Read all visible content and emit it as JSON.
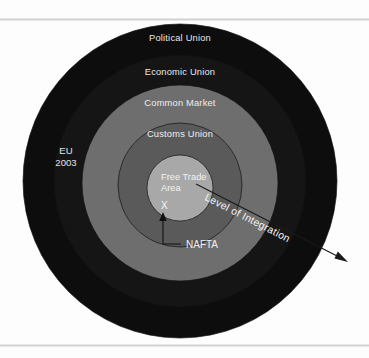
{
  "figure": {
    "background_color": "#fdfdfd"
  },
  "rings": [
    {
      "id": "political-union",
      "label": "Political Union",
      "radius": 157,
      "fill": "#0d0d0d",
      "label_x": 180,
      "label_y": 41
    },
    {
      "id": "economic-union",
      "label": "Economic Union",
      "radius": 126,
      "fill": "#151515",
      "label_x": 180,
      "label_y": 75
    },
    {
      "id": "common-market",
      "label": "Common Market",
      "radius": 98,
      "fill": "#6e6e6e",
      "label_x": 180,
      "label_y": 106
    },
    {
      "id": "customs-union",
      "label": "Customs Union",
      "radius": 62,
      "fill": "#5a5a5a",
      "label_x": 180,
      "label_y": 137
    },
    {
      "id": "free-trade-area",
      "label": "Free Trade Area",
      "radius": 33,
      "fill": "#a8a8a8",
      "label_x": 180,
      "label_y": 137
    }
  ],
  "core": {
    "line1": "Free Trade",
    "line2": "Area",
    "marker": "X",
    "center_x": 180,
    "center_y": 188,
    "radius": 33
  },
  "eu_annotation": {
    "line1": "EU",
    "line2": "2003",
    "x": 66,
    "y": 154
  },
  "nafta_annotation": {
    "label": "NAFTA",
    "x": 186,
    "y": 243
  },
  "axis_annotation": {
    "label": "Level of Integration",
    "rotation_deg": 27,
    "x": 246,
    "y": 225
  },
  "colors": {
    "outer_ring": "#0d0d0d",
    "economic_ring": "#151515",
    "common_market_ring": "#6e6e6e",
    "customs_ring": "#5a5a5a",
    "core_circle": "#a8a8a8",
    "label_text": "#e9e9e9",
    "rule": "#d2d2d4",
    "page": "#fdfdfd"
  }
}
